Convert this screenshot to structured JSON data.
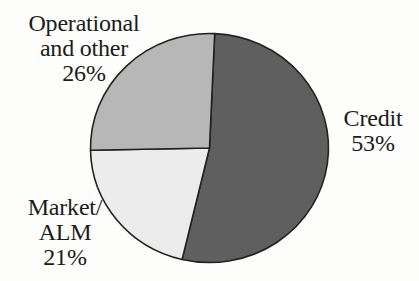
{
  "figure": {
    "background_color": "#fdfdfc",
    "text_color": "#1b1b1b"
  },
  "chart_data": {
    "type": "pie",
    "title": "",
    "categories": [
      "Credit",
      "Market/ALM",
      "Operational and other"
    ],
    "values": [
      53,
      21,
      26
    ],
    "unit": "percent",
    "direction": "clockwise",
    "start_angle_deg": 2.5,
    "legend": "none",
    "label_placement": "outside",
    "stroke_color": "#222222",
    "stroke_width": 1.6,
    "center": {
      "x": 209.5,
      "y": 148
    },
    "radius": {
      "x": 119,
      "y": 114.5
    },
    "slices": [
      {
        "name": "Credit",
        "value": 53,
        "percent_label": "53%",
        "color": "#5f5f5f",
        "label": "Credit\n53%"
      },
      {
        "name": "Market/ALM",
        "value": 21,
        "percent_label": "21%",
        "color": "#ececec",
        "label": "Market/\nALM\n21%"
      },
      {
        "name": "Operational and other",
        "value": 26,
        "percent_label": "26%",
        "color": "#b7b7b7",
        "label": "Operational\nand other\n26%"
      }
    ]
  }
}
